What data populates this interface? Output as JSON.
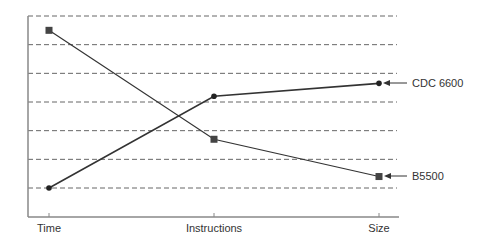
{
  "chart_data": {
    "type": "line",
    "title": "",
    "xlabel": "",
    "ylabel": "",
    "categories": [
      "Time",
      "Instructions",
      "Size"
    ],
    "series": [
      {
        "name": "B5500",
        "marker": "square",
        "values": [
          6.5,
          2.7,
          1.4
        ]
      },
      {
        "name": "CDC 6600",
        "marker": "circle",
        "values": [
          1.0,
          4.2,
          4.65
        ]
      }
    ],
    "ylim": [
      0,
      7
    ],
    "grid": {
      "horizontal": true,
      "style": "dashed",
      "lines": 7
    },
    "yticks_labeled": false,
    "legend_position": "inline-right-annotations"
  },
  "annotations": {
    "cdc": "CDC 6600",
    "b5500": "B5500"
  },
  "colors": {
    "line": "#333333",
    "grid": "#666666",
    "axis": "#888888",
    "text": "#333333"
  }
}
